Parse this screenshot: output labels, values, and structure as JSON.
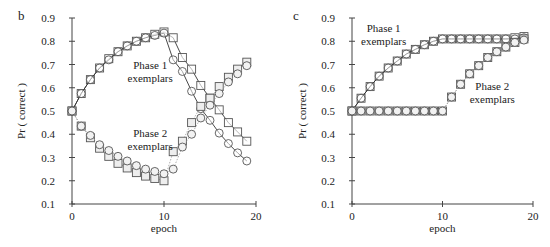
{
  "chart_data": [
    {
      "panel": "b",
      "type": "line",
      "title": "",
      "xlabel": "epoch",
      "ylabel": "Pr ( correct )",
      "xlim": [
        0,
        20
      ],
      "ylim": [
        0.1,
        0.9
      ],
      "xticks": [
        "0",
        "10",
        "20"
      ],
      "yticks": [
        "0.1",
        "0.2",
        "0.3",
        "0.4",
        "0.5",
        "0.6",
        "0.7",
        "0.8",
        "0.9"
      ],
      "grid": false,
      "legend": "none",
      "annotations": [
        {
          "text": [
            "Phase 1",
            "exemplars"
          ],
          "x": 8.5,
          "y": 0.68
        },
        {
          "text": [
            "Phase 2",
            "exemplars"
          ],
          "x": 8.5,
          "y": 0.39
        }
      ],
      "x": [
        0,
        1,
        2,
        3,
        4,
        5,
        6,
        7,
        8,
        9,
        10,
        11,
        12,
        13,
        14,
        15,
        16,
        17,
        18,
        19
      ],
      "series": [
        {
          "name": "Phase 1 exemplars (squares)",
          "marker": "square",
          "line": "solid",
          "values": [
            0.5,
            0.575,
            0.635,
            0.685,
            0.725,
            0.755,
            0.78,
            0.8,
            0.815,
            0.83,
            0.84,
            0.815,
            0.73,
            0.68,
            0.61,
            0.555,
            0.505,
            0.45,
            0.41,
            0.37
          ]
        },
        {
          "name": "Phase 1 exemplars (circles)",
          "marker": "circle",
          "line": "solid",
          "values": [
            0.5,
            0.575,
            0.635,
            0.685,
            0.72,
            0.755,
            0.78,
            0.8,
            0.815,
            0.825,
            0.835,
            0.72,
            0.67,
            0.585,
            0.51,
            0.46,
            0.405,
            0.36,
            0.32,
            0.285
          ]
        },
        {
          "name": "Phase 2 exemplars (squares)",
          "marker": "square",
          "line": "dotted",
          "values": [
            0.5,
            0.435,
            0.385,
            0.34,
            0.305,
            0.275,
            0.255,
            0.235,
            0.22,
            0.21,
            0.2,
            0.325,
            0.37,
            0.45,
            0.52,
            0.555,
            0.605,
            0.645,
            0.68,
            0.71
          ]
        },
        {
          "name": "Phase 2 exemplars (circles)",
          "marker": "circle",
          "line": "dotted",
          "values": [
            0.5,
            0.435,
            0.395,
            0.355,
            0.33,
            0.305,
            0.285,
            0.265,
            0.25,
            0.24,
            0.23,
            0.25,
            0.345,
            0.4,
            0.47,
            0.525,
            0.575,
            0.625,
            0.66,
            0.695
          ]
        }
      ]
    },
    {
      "panel": "c",
      "type": "line",
      "title": "",
      "xlabel": "epoch",
      "ylabel": "Pr ( correct )",
      "xlim": [
        0,
        20
      ],
      "ylim": [
        0.1,
        0.9
      ],
      "xticks": [
        "0",
        "10",
        "20"
      ],
      "yticks": [
        "0.1",
        "0.2",
        "0.3",
        "0.4",
        "0.5",
        "0.6",
        "0.7",
        "0.8",
        "0.9"
      ],
      "grid": false,
      "legend": "none",
      "annotations": [
        {
          "text": [
            "Phase 1",
            "exemplars"
          ],
          "x": 3.5,
          "y": 0.84
        },
        {
          "text": [
            "Phase 2",
            "exemplars"
          ],
          "x": 15.5,
          "y": 0.59
        }
      ],
      "x": [
        0,
        1,
        2,
        3,
        4,
        5,
        6,
        7,
        8,
        9,
        10,
        11,
        12,
        13,
        14,
        15,
        16,
        17,
        18,
        19
      ],
      "series": [
        {
          "name": "Phase 1 exemplars (squares)",
          "marker": "square",
          "line": "solid",
          "values": [
            0.5,
            0.555,
            0.605,
            0.65,
            0.685,
            0.715,
            0.745,
            0.765,
            0.785,
            0.8,
            0.81,
            0.81,
            0.81,
            0.81,
            0.81,
            0.81,
            0.81,
            0.81,
            0.815,
            0.82
          ]
        },
        {
          "name": "Phase 1 exemplars (circles)",
          "marker": "circle",
          "line": "solid",
          "values": [
            0.5,
            0.555,
            0.605,
            0.65,
            0.685,
            0.715,
            0.745,
            0.765,
            0.785,
            0.8,
            0.81,
            0.81,
            0.81,
            0.81,
            0.81,
            0.81,
            0.81,
            0.81,
            0.81,
            0.815
          ]
        },
        {
          "name": "Phase 2 exemplars (squares)",
          "marker": "square",
          "line": "dotted",
          "values": [
            0.5,
            0.5,
            0.5,
            0.5,
            0.5,
            0.5,
            0.5,
            0.5,
            0.5,
            0.5,
            0.5,
            0.56,
            0.615,
            0.66,
            0.695,
            0.73,
            0.755,
            0.775,
            0.795,
            0.81
          ]
        },
        {
          "name": "Phase 2 exemplars (circles)",
          "marker": "circle",
          "line": "dotted",
          "values": [
            0.5,
            0.5,
            0.5,
            0.5,
            0.5,
            0.5,
            0.5,
            0.5,
            0.5,
            0.5,
            0.5,
            0.56,
            0.615,
            0.66,
            0.695,
            0.73,
            0.755,
            0.775,
            0.795,
            0.805
          ]
        }
      ]
    }
  ],
  "panels": {
    "b": {
      "label": "b",
      "ylabel": "Pr ( correct )",
      "xlabel": "epoch",
      "annot1": [
        "Phase 1",
        "exemplars"
      ],
      "annot2": [
        "Phase 2",
        "exemplars"
      ]
    },
    "c": {
      "label": "c",
      "ylabel": "Pr ( correct )",
      "xlabel": "epoch",
      "annot1": [
        "Phase 1",
        "exemplars"
      ],
      "annot2": [
        "Phase 2",
        "exemplars"
      ]
    }
  }
}
